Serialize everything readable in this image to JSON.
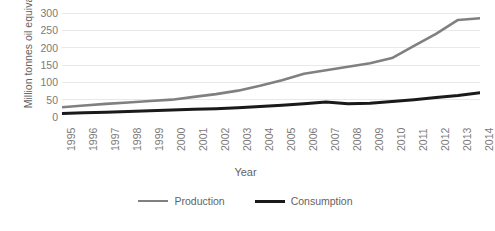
{
  "chart_data": {
    "type": "line",
    "title": "",
    "xlabel": "Year",
    "ylabel": "Million tonnes oil equivalent",
    "categories": [
      "1995",
      "1996",
      "1997",
      "1998",
      "1999",
      "2000",
      "2001",
      "2002",
      "2003",
      "2004",
      "2005",
      "2006",
      "2007",
      "2008",
      "2009",
      "2010",
      "2011",
      "2012",
      "2013",
      "2014"
    ],
    "x": [
      1995,
      1996,
      1997,
      1998,
      1999,
      2000,
      2001,
      2002,
      2003,
      2004,
      2005,
      2006,
      2007,
      2008,
      2009,
      2010,
      2011,
      2012,
      2013,
      2014
    ],
    "series": [
      {
        "name": "Production",
        "color": "#808080",
        "values": [
          28,
          33,
          38,
          42,
          46,
          50,
          58,
          66,
          76,
          90,
          106,
          125,
          135,
          145,
          155,
          170,
          205,
          240,
          280,
          285
        ]
      },
      {
        "name": "Consumption",
        "color": "#1a1a1a",
        "values": [
          10,
          12,
          14,
          16,
          18,
          20,
          22,
          24,
          27,
          30,
          34,
          38,
          43,
          38,
          40,
          45,
          50,
          56,
          62,
          70
        ]
      }
    ],
    "ylim": [
      0,
      300
    ],
    "yticks": [
      0,
      50,
      100,
      150,
      200,
      250,
      300
    ],
    "ytick_labels": [
      "0",
      "50",
      "100",
      "150",
      "200",
      "250",
      "300"
    ],
    "grid": "horizontal",
    "legend_position": "bottom"
  },
  "legend": {
    "items": [
      {
        "label": "Production",
        "color": "#808080"
      },
      {
        "label": "Consumption",
        "color": "#1a1a1a"
      }
    ]
  }
}
